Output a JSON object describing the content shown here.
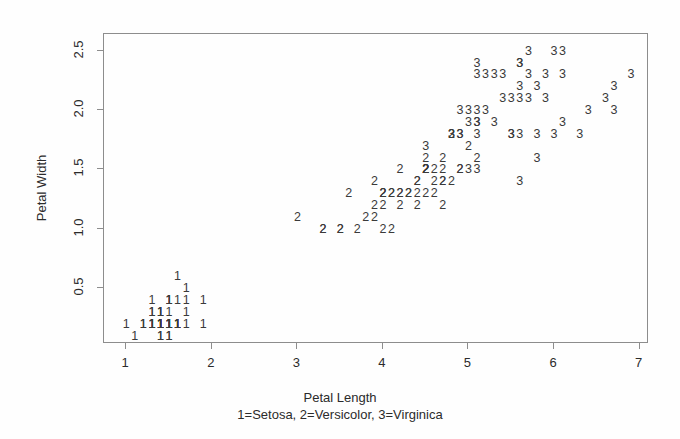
{
  "figure": {
    "width": 680,
    "height": 439,
    "background": "#fefefe",
    "ink_color": "#3a3a3a",
    "frame_color": "#8d8d8d",
    "plot_box": {
      "left": 103,
      "top": 33,
      "right": 648,
      "bottom": 343
    }
  },
  "axes": {
    "x_label": "Petal Length",
    "x_subtitle": "1=Setosa, 2=Versicolor, 3=Virginica",
    "y_label": "Petal Width",
    "x_ticks": [
      "1",
      "2",
      "3",
      "4",
      "5",
      "6",
      "7"
    ],
    "x_tick_values": [
      1,
      2,
      3,
      4,
      5,
      6,
      7
    ],
    "y_ticks": [
      "0.5",
      "1.0",
      "1.5",
      "2.0",
      "2.5"
    ],
    "y_tick_values": [
      0.5,
      1.0,
      1.5,
      2.0,
      2.5
    ]
  },
  "chart_data": {
    "type": "scatter",
    "title": "",
    "xlabel": "Petal Length",
    "ylabel": "Petal Width",
    "subtitle": "1=Setosa, 2=Versicolor, 3=Virginica",
    "grid": false,
    "legend": "none",
    "xlim": [
      0.74,
      7.11
    ],
    "ylim": [
      0.03,
      2.64
    ],
    "point_marker": "digit-glyph",
    "series": [
      {
        "name": "Setosa",
        "code": "1",
        "label": "1=Setosa",
        "x": [
          1.4,
          1.4,
          1.3,
          1.5,
          1.4,
          1.7,
          1.4,
          1.5,
          1.4,
          1.5,
          1.5,
          1.6,
          1.4,
          1.1,
          1.2,
          1.5,
          1.3,
          1.4,
          1.7,
          1.5,
          1.7,
          1.5,
          1.0,
          1.7,
          1.9,
          1.6,
          1.6,
          1.5,
          1.4,
          1.6,
          1.6,
          1.5,
          1.5,
          1.4,
          1.5,
          1.2,
          1.3,
          1.4,
          1.3,
          1.5,
          1.3,
          1.3,
          1.3,
          1.6,
          1.9,
          1.4,
          1.6,
          1.4,
          1.5,
          1.4
        ],
        "y": [
          0.2,
          0.2,
          0.2,
          0.2,
          0.2,
          0.4,
          0.3,
          0.2,
          0.2,
          0.1,
          0.2,
          0.2,
          0.1,
          0.1,
          0.2,
          0.4,
          0.4,
          0.3,
          0.3,
          0.3,
          0.2,
          0.4,
          0.2,
          0.5,
          0.2,
          0.2,
          0.4,
          0.2,
          0.2,
          0.2,
          0.2,
          0.4,
          0.1,
          0.2,
          0.2,
          0.2,
          0.2,
          0.1,
          0.2,
          0.2,
          0.3,
          0.3,
          0.2,
          0.6,
          0.4,
          0.3,
          0.2,
          0.2,
          0.2,
          0.2
        ]
      },
      {
        "name": "Versicolor",
        "code": "2",
        "label": "2=Versicolor",
        "x": [
          4.7,
          4.5,
          4.9,
          4.0,
          4.6,
          4.5,
          4.7,
          3.3,
          4.6,
          3.9,
          3.5,
          4.2,
          4.0,
          4.7,
          3.6,
          4.4,
          4.5,
          4.1,
          4.5,
          3.9,
          4.8,
          4.0,
          4.9,
          4.7,
          4.3,
          4.4,
          4.8,
          5.0,
          4.5,
          3.5,
          3.8,
          3.7,
          3.9,
          5.1,
          4.5,
          4.5,
          4.7,
          4.4,
          4.1,
          4.0,
          4.4,
          4.6,
          4.0,
          3.3,
          4.2,
          4.2,
          4.2,
          4.3,
          3.0,
          4.1
        ],
        "y": [
          1.4,
          1.5,
          1.5,
          1.3,
          1.5,
          1.3,
          1.6,
          1.0,
          1.3,
          1.4,
          1.0,
          1.5,
          1.0,
          1.4,
          1.3,
          1.4,
          1.5,
          1.0,
          1.5,
          1.1,
          1.8,
          1.3,
          1.5,
          1.2,
          1.3,
          1.4,
          1.4,
          1.7,
          1.5,
          1.0,
          1.1,
          1.0,
          1.2,
          1.6,
          1.5,
          1.6,
          1.5,
          1.3,
          1.3,
          1.3,
          1.2,
          1.4,
          1.2,
          1.0,
          1.3,
          1.2,
          1.3,
          1.3,
          1.1,
          1.3
        ]
      },
      {
        "name": "Virginica",
        "code": "3",
        "label": "3=Virginica",
        "x": [
          6.0,
          5.1,
          5.9,
          5.6,
          5.8,
          6.6,
          4.5,
          6.3,
          5.8,
          6.1,
          5.1,
          5.3,
          5.5,
          5.0,
          5.1,
          5.3,
          5.5,
          6.7,
          6.9,
          5.0,
          5.7,
          4.9,
          6.7,
          4.9,
          5.7,
          6.0,
          4.8,
          4.9,
          5.6,
          5.8,
          6.1,
          6.4,
          5.6,
          5.1,
          5.6,
          6.1,
          5.6,
          5.5,
          4.8,
          5.4,
          5.6,
          5.1,
          5.1,
          5.9,
          5.7,
          5.2,
          5.0,
          5.2,
          5.4,
          5.1
        ],
        "y": [
          2.5,
          1.9,
          2.1,
          1.8,
          2.2,
          2.1,
          1.7,
          1.8,
          1.8,
          2.5,
          2.0,
          1.9,
          2.1,
          2.0,
          2.4,
          2.3,
          1.8,
          2.2,
          2.3,
          1.5,
          2.3,
          2.0,
          2.0,
          1.8,
          2.1,
          1.8,
          1.8,
          1.8,
          2.1,
          1.6,
          1.9,
          2.0,
          2.2,
          1.5,
          1.4,
          2.3,
          2.4,
          1.8,
          1.8,
          2.1,
          2.4,
          2.3,
          1.9,
          2.3,
          2.5,
          2.3,
          1.9,
          2.0,
          2.3,
          1.8
        ]
      }
    ]
  }
}
